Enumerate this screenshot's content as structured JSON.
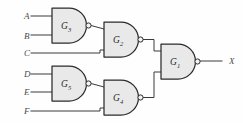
{
  "figure": {
    "background_color": "#fefefe",
    "gate_fill_color": "#e9e9e9",
    "gate_stroke_color": "#2b2b2b",
    "wire_color": "#3a3a3a"
  },
  "inputs": [
    {
      "id": "A",
      "label": "A",
      "label_x": 24,
      "label_y": 19,
      "wire_y": 16,
      "wire_x_start": 31,
      "wire_x_end": 52
    },
    {
      "id": "B",
      "label": "B",
      "label_x": 24,
      "label_y": 39,
      "wire_y": 35,
      "wire_x_start": 31,
      "wire_x_end": 52
    },
    {
      "id": "C",
      "label": "C",
      "label_x": 24,
      "label_y": 56,
      "wire_y": 53,
      "wire_x_start": 31,
      "wire_x_end": 100
    },
    {
      "id": "D",
      "label": "D",
      "label_x": 24,
      "label_y": 77,
      "wire_y": 74,
      "wire_x_start": 31,
      "wire_x_end": 52
    },
    {
      "id": "E",
      "label": "E",
      "label_x": 24,
      "label_y": 95,
      "wire_y": 92,
      "wire_x_start": 31,
      "wire_x_end": 52
    },
    {
      "id": "F",
      "label": "F",
      "label_x": 24,
      "label_y": 114,
      "wire_y": 111,
      "wire_x_start": 31,
      "wire_x_end": 100
    }
  ],
  "outputs": [
    {
      "id": "X",
      "label": "X",
      "label_x": 229,
      "label_y": 64,
      "wire_y": 61,
      "wire_x_start": 203,
      "wire_x_end": 222
    }
  ],
  "gates": [
    {
      "id": "G3",
      "name": "G3",
      "label_main": "G",
      "label_sub": "3",
      "type": "NAND",
      "x": 52,
      "y": 8,
      "width": 33,
      "height": 35,
      "bubble_cx": 88.5,
      "bubble_cy": 25.5,
      "bubble_r": 2.6,
      "label_x": 63,
      "label_y": 29,
      "inputs": [
        "A",
        "B"
      ],
      "output_to": "G2"
    },
    {
      "id": "G2",
      "name": "G2",
      "label_main": "G",
      "label_sub": "2",
      "type": "NAND",
      "x": 104,
      "y": 22,
      "width": 33,
      "height": 35,
      "bubble_cx": 140.5,
      "bubble_cy": 39.5,
      "bubble_r": 2.6,
      "label_x": 115,
      "label_y": 43,
      "inputs": [
        "G3",
        "C"
      ],
      "output_to": "G1"
    },
    {
      "id": "G5",
      "name": "G5",
      "label_main": "G",
      "label_sub": "5",
      "type": "NAND",
      "x": 52,
      "y": 66,
      "width": 33,
      "height": 35,
      "bubble_cx": 88.5,
      "bubble_cy": 83.5,
      "bubble_r": 2.6,
      "label_x": 63,
      "label_y": 87,
      "inputs": [
        "D",
        "E"
      ],
      "output_to": "G4"
    },
    {
      "id": "G4",
      "name": "G4",
      "label_main": "G",
      "label_sub": "4",
      "type": "NAND",
      "x": 104,
      "y": 80,
      "width": 33,
      "height": 35,
      "bubble_cx": 140.5,
      "bubble_cy": 97.5,
      "bubble_r": 2.6,
      "label_x": 115,
      "label_y": 101,
      "inputs": [
        "G5",
        "F"
      ],
      "output_to": "G1"
    },
    {
      "id": "G1",
      "name": "G1",
      "label_main": "G",
      "label_sub": "1",
      "type": "NAND",
      "x": 161,
      "y": 44,
      "width": 33,
      "height": 35,
      "bubble_cx": 197.5,
      "bubble_cy": 61.5,
      "bubble_r": 2.6,
      "label_x": 172,
      "label_y": 65,
      "inputs": [
        "G2",
        "G4"
      ],
      "output_to": "X"
    }
  ],
  "wires": [
    {
      "id": "wire-a-to-g3",
      "from": "A",
      "to": "G3",
      "path": "M31,16 L52,16"
    },
    {
      "id": "wire-b-to-g3",
      "from": "B",
      "to": "G3",
      "path": "M31,35 L52,35"
    },
    {
      "id": "wire-g3-to-g2",
      "from": "G3",
      "to": "G2",
      "path": "M91,25.5 L104,29"
    },
    {
      "id": "wire-c-to-g2",
      "from": "C",
      "to": "G2",
      "path": "M31,53 L100,53 L100,50 L104,50"
    },
    {
      "id": "wire-d-to-g5",
      "from": "D",
      "to": "G5",
      "path": "M31,74 L52,74"
    },
    {
      "id": "wire-e-to-g5",
      "from": "E",
      "to": "G5",
      "path": "M31,92 L52,92"
    },
    {
      "id": "wire-g5-to-g4",
      "from": "G5",
      "to": "G4",
      "path": "M91,83.5 L104,87"
    },
    {
      "id": "wire-f-to-g4",
      "from": "F",
      "to": "G4",
      "path": "M31,111 L100,111 L100,108 L104,108"
    },
    {
      "id": "wire-g2-to-g1",
      "from": "G2",
      "to": "G1",
      "path": "M143,39.5 L154,39.5 L154,51 L161,51"
    },
    {
      "id": "wire-g4-to-g1",
      "from": "G4",
      "to": "G1",
      "path": "M143,97.5 L154,97.5 L154,72 L161,72"
    },
    {
      "id": "wire-g1-to-x",
      "from": "G1",
      "to": "X",
      "path": "M200,61 L222,61"
    }
  ]
}
